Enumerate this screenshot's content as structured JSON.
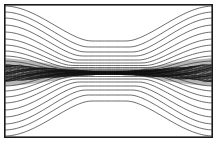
{
  "figure": {
    "domain_type": "contour-plot",
    "width": 221,
    "height": 146,
    "background_color": "#ffffff",
    "frame": {
      "x": 4.5,
      "y": 4.5,
      "width": 208,
      "height": 133,
      "stroke_color": "#1a1a1a",
      "stroke_width": 1.6
    },
    "title": "",
    "xlabel": "",
    "ylabel": "",
    "has_axis_ticks": false,
    "has_tick_labels": false,
    "has_legend": false,
    "has_colorbar": false,
    "annotations": []
  },
  "chart_data": {
    "type": "contour",
    "title": "",
    "subtitle": "",
    "xlabel": "",
    "ylabel": "",
    "xlim": [
      4.5,
      212.5
    ],
    "ylim": [
      4.5,
      137.5
    ],
    "grid": false,
    "legend_position": "none",
    "contour_line_color": "#3c3c3c",
    "sheet_line_color": "#121212",
    "contour_line_width": 0.75,
    "midline_y": 73,
    "shading": {
      "label": "shaded-inflow-wedge",
      "color": "#b8b8b8",
      "left_wedge": {
        "x_start": 5,
        "x_end": 96,
        "y_top_at_edge": 58,
        "y_bottom_at_edge": 86,
        "y_top_at_tip": 71,
        "y_bottom_at_tip": 75
      },
      "right_wedge": {
        "x_start": 212,
        "x_end": 124,
        "y_top_at_edge": 58,
        "y_bottom_at_edge": 86,
        "y_top_at_tip": 71,
        "y_bottom_at_tip": 75
      }
    },
    "upper_contours": {
      "count": 11,
      "edge_y_values": [
        6,
        12,
        18,
        25,
        32,
        39,
        45,
        51,
        56,
        61,
        65
      ],
      "center_y_values": [
        41,
        47,
        52,
        56,
        60,
        63,
        65.5,
        67.5,
        69,
        70,
        71
      ]
    },
    "lower_contours": {
      "count": 11,
      "edge_y_values": [
        136,
        130,
        124,
        117,
        110,
        103,
        97,
        91,
        86,
        81,
        77
      ],
      "center_y_values": [
        101,
        95,
        90,
        86,
        82,
        79,
        76.5,
        74.5,
        73,
        72,
        71
      ]
    },
    "sheet_band": {
      "label": "dense-current-sheet-band",
      "count": 22,
      "y_top": 66,
      "y_bottom": 81,
      "x_start": 5,
      "x_end": 212,
      "narrowest_x": 110,
      "narrowest_half_width": 1.2,
      "widest_half_width": 7.5
    }
  }
}
